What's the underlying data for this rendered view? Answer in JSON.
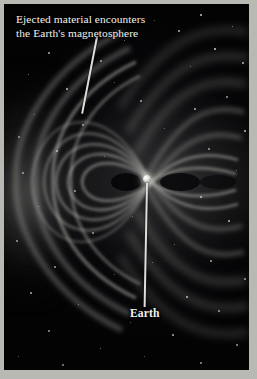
{
  "figure": {
    "kind": "astronomy-illustration",
    "background_color": "#050506",
    "border_color": "#b9b9b4"
  },
  "annotations": {
    "top_caption": {
      "line1": "Ejected material encounters",
      "line2": "the Earth's magnetosphere",
      "color": "#f2f2ec"
    },
    "earth_label": {
      "text": "Earth",
      "color": "#f2f2ec"
    }
  },
  "objects": {
    "earth": {
      "name": "Earth",
      "color": "#e7e7e2"
    },
    "bow_shock": {
      "name": "bow-shock",
      "color": "#9a9a95"
    },
    "magnetotail": {
      "name": "magnetotail",
      "color": "#8e8e89"
    },
    "field_lines": {
      "name": "magnetic-field-lines",
      "color": "#a2a29c"
    },
    "solar_wind": {
      "name": "solar-wind-haze",
      "color": "#969692"
    }
  }
}
